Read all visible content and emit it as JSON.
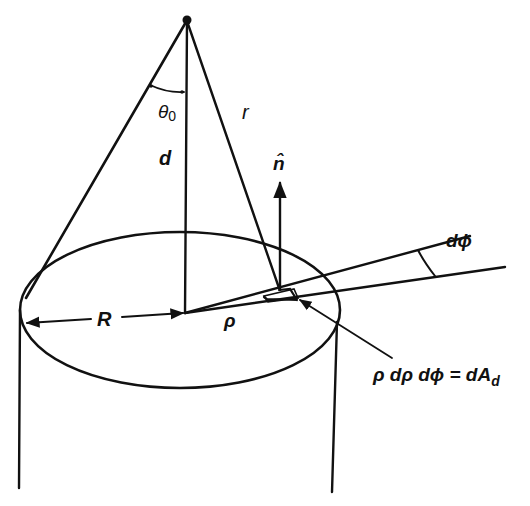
{
  "figure": {
    "type": "geometry-diagram",
    "colors": {
      "ink": "#111111",
      "background": "#ffffff"
    }
  },
  "labels": {
    "theta0": "θ",
    "theta0_sub": "0",
    "d": "d",
    "r": "r",
    "n_hat": "n̂",
    "R": "R",
    "rho": "ρ",
    "dphi": "dϕ",
    "area_element_lhs": "ρ dρ dϕ = dA",
    "area_element_sub": "d"
  },
  "geometry": {
    "apex": [
      187,
      20
    ],
    "disk_center": [
      185,
      313
    ],
    "ellipse": {
      "cx": 180,
      "cy": 310,
      "rx": 160,
      "ry": 78
    },
    "element_point": [
      290,
      290
    ]
  }
}
